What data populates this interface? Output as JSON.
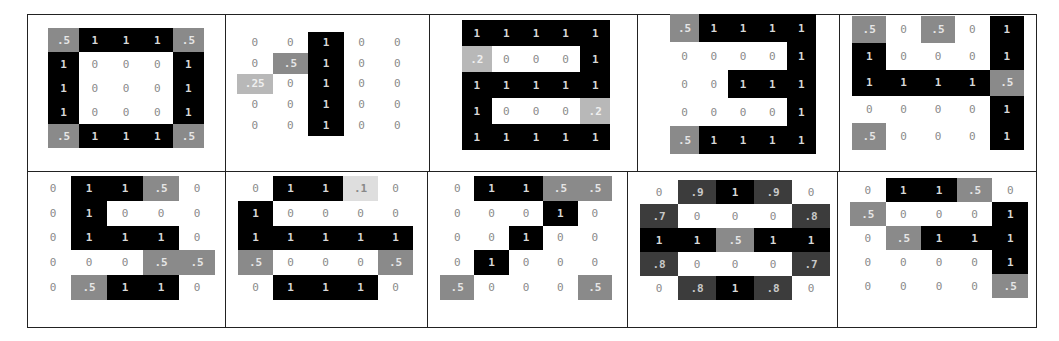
{
  "figure": {
    "panels": [
      {
        "digit": "0",
        "grid": [
          [
            ".5",
            "1",
            "1",
            "1",
            ".5"
          ],
          [
            "1",
            "0",
            "0",
            "0",
            "1"
          ],
          [
            "1",
            "0",
            "0",
            "0",
            "1"
          ],
          [
            "1",
            "0",
            "0",
            "0",
            "1"
          ],
          [
            ".5",
            "1",
            "1",
            "1",
            ".5"
          ]
        ]
      },
      {
        "digit": "1",
        "grid": [
          [
            "0",
            "0",
            "1",
            "0",
            "0"
          ],
          [
            "0",
            ".5",
            "1",
            "0",
            "0"
          ],
          [
            ".25",
            "0",
            "1",
            "0",
            "0"
          ],
          [
            "0",
            "0",
            "1",
            "0",
            "0"
          ],
          [
            "0",
            "0",
            "1",
            "0",
            "0"
          ]
        ]
      },
      {
        "digit": "2",
        "grid": [
          [
            "1",
            "1",
            "1",
            "1",
            "1"
          ],
          [
            ".2",
            "0",
            "0",
            "0",
            "1"
          ],
          [
            "1",
            "1",
            "1",
            "1",
            "1"
          ],
          [
            "1",
            "0",
            "0",
            "0",
            ".2"
          ],
          [
            "1",
            "1",
            "1",
            "1",
            "1"
          ]
        ]
      },
      {
        "digit": "3",
        "grid": [
          [
            ".5",
            "1",
            "1",
            "1",
            "1"
          ],
          [
            "0",
            "0",
            "0",
            "0",
            "1"
          ],
          [
            "0",
            "0",
            "1",
            "1",
            "1"
          ],
          [
            "0",
            "0",
            "0",
            "0",
            "1"
          ],
          [
            ".5",
            "1",
            "1",
            "1",
            "1"
          ]
        ]
      },
      {
        "digit": "4",
        "grid": [
          [
            ".5",
            "0",
            ".5",
            "0",
            "1"
          ],
          [
            "1",
            "0",
            "0",
            "0",
            "1"
          ],
          [
            "1",
            "1",
            "1",
            "1",
            ".5"
          ],
          [
            "0",
            "0",
            "0",
            "0",
            "1"
          ],
          [
            ".5",
            "0",
            "0",
            "0",
            "1"
          ]
        ]
      },
      {
        "digit": "5",
        "grid": [
          [
            "0",
            "1",
            "1",
            ".5",
            "0"
          ],
          [
            "0",
            "1",
            "0",
            "0",
            "0"
          ],
          [
            "0",
            "1",
            "1",
            "1",
            "0"
          ],
          [
            "0",
            "0",
            "0",
            ".5",
            ".5"
          ],
          [
            "0",
            ".5",
            "1",
            "1",
            "0"
          ]
        ]
      },
      {
        "digit": "6",
        "grid": [
          [
            "0",
            "1",
            "1",
            ".1",
            "0"
          ],
          [
            "1",
            "0",
            "0",
            "0",
            "0"
          ],
          [
            "1",
            "1",
            "1",
            "1",
            "1"
          ],
          [
            ".5",
            "0",
            "0",
            "0",
            ".5"
          ],
          [
            "0",
            "1",
            "1",
            "1",
            "0"
          ]
        ]
      },
      {
        "digit": "7",
        "grid": [
          [
            "0",
            "1",
            "1",
            ".5",
            ".5"
          ],
          [
            "0",
            "0",
            "0",
            "1",
            "0"
          ],
          [
            "0",
            "0",
            "1",
            "0",
            "0"
          ],
          [
            "0",
            "1",
            "0",
            "0",
            "0"
          ],
          [
            ".5",
            "0",
            "0",
            "0",
            ".5"
          ]
        ]
      },
      {
        "digit": "8",
        "grid": [
          [
            "0",
            ".9",
            "1",
            ".9",
            "0"
          ],
          [
            ".7",
            "0",
            "0",
            "0",
            ".8"
          ],
          [
            "1",
            "1",
            ".5",
            "1",
            "1"
          ],
          [
            ".8",
            "0",
            "0",
            "0",
            ".7"
          ],
          [
            "0",
            ".8",
            "1",
            ".8",
            "0"
          ]
        ]
      },
      {
        "digit": "9",
        "grid": [
          [
            "0",
            "1",
            "1",
            ".5",
            "0"
          ],
          [
            ".5",
            "0",
            "0",
            "0",
            "1"
          ],
          [
            "0",
            ".5",
            "1",
            "1",
            "1"
          ],
          [
            "0",
            "0",
            "0",
            "0",
            "1"
          ],
          [
            "0",
            "0",
            "0",
            "0",
            ".5"
          ]
        ]
      }
    ]
  },
  "layout": {
    "top_splits": [
      27,
      226,
      430,
      638,
      840,
      1037
    ],
    "bottom_splits": [
      27,
      226,
      428,
      628,
      838,
      1037
    ],
    "row_top": [
      14,
      172
    ],
    "row_bottom": [
      172,
      328
    ],
    "grid_boxes": [
      {
        "x": 48,
        "y": 28,
        "w": 156,
        "h": 120
      },
      {
        "x": 237,
        "y": 32,
        "w": 178,
        "h": 104
      },
      {
        "x": 462,
        "y": 20,
        "w": 148,
        "h": 130
      },
      {
        "x": 670,
        "y": 14,
        "w": 146,
        "h": 140
      },
      {
        "x": 852,
        "y": 16,
        "w": 172,
        "h": 134
      },
      {
        "x": 35,
        "y": 176,
        "w": 180,
        "h": 124
      },
      {
        "x": 238,
        "y": 176,
        "w": 175,
        "h": 124
      },
      {
        "x": 440,
        "y": 176,
        "w": 172,
        "h": 124
      },
      {
        "x": 640,
        "y": 180,
        "w": 190,
        "h": 120
      },
      {
        "x": 850,
        "y": 178,
        "w": 178,
        "h": 120
      }
    ]
  },
  "colors": {
    "full": "#000000",
    "high": "#3c3c3c",
    "mid": "#8a8a8a",
    "low": "#b8b8b8",
    "very_low": "#dedede",
    "zero": "#ffffff",
    "border": "#222222"
  }
}
